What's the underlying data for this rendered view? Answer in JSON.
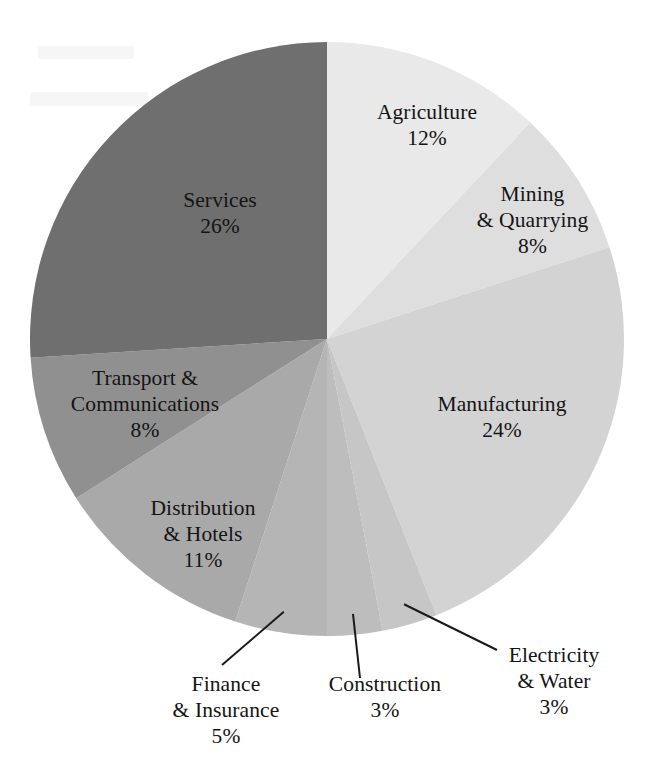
{
  "chart_data": {
    "type": "pie",
    "title": "",
    "subtitle": "",
    "xlabel": "",
    "ylabel": "",
    "units": "percent",
    "total": 100,
    "legend_position": "none",
    "grid": false,
    "start_angle_deg": 0,
    "direction": "clockwise",
    "categories": [
      "Agriculture",
      "Mining & Quarrying",
      "Manufacturing",
      "Electricity & Water",
      "Construction",
      "Finance & Insurance",
      "Distribution & Hotels",
      "Transport & Communications",
      "Services"
    ],
    "values": [
      12,
      8,
      24,
      3,
      3,
      5,
      11,
      8,
      26
    ],
    "slices": [
      {
        "name": "Agriculture",
        "line1": "Agriculture",
        "line2": "",
        "value": 12,
        "pct_label": "12%",
        "color": "#e9e9e9",
        "label_placement": "inside",
        "leader_line": false
      },
      {
        "name": "Mining & Quarrying",
        "line1": "Mining",
        "line2": "& Quarrying",
        "value": 8,
        "pct_label": "8%",
        "color": "#dedede",
        "label_placement": "inside",
        "leader_line": false
      },
      {
        "name": "Manufacturing",
        "line1": "Manufacturing",
        "line2": "",
        "value": 24,
        "pct_label": "24%",
        "color": "#d3d3d3",
        "label_placement": "inside",
        "leader_line": false
      },
      {
        "name": "Electricity & Water",
        "line1": "Electricity",
        "line2": "& Water",
        "value": 3,
        "pct_label": "3%",
        "color": "#c6c6c6",
        "label_placement": "outside",
        "leader_line": true
      },
      {
        "name": "Construction",
        "line1": "Construction",
        "line2": "",
        "value": 3,
        "pct_label": "3%",
        "color": "#bdbdbd",
        "label_placement": "outside",
        "leader_line": true
      },
      {
        "name": "Finance & Insurance",
        "line1": "Finance",
        "line2": "& Insurance",
        "value": 5,
        "pct_label": "5%",
        "color": "#b5b5b5",
        "label_placement": "outside",
        "leader_line": true
      },
      {
        "name": "Distribution & Hotels",
        "line1": "Distribution",
        "line2": "& Hotels",
        "value": 11,
        "pct_label": "11%",
        "color": "#a9a9a9",
        "label_placement": "inside",
        "leader_line": false
      },
      {
        "name": "Transport & Communications",
        "line1": "Transport &",
        "line2": "Communications",
        "value": 8,
        "pct_label": "8%",
        "color": "#909090",
        "label_placement": "inside",
        "leader_line": false
      },
      {
        "name": "Services",
        "line1": "Services",
        "line2": "",
        "value": 26,
        "pct_label": "26%",
        "color": "#6f6f6f",
        "label_placement": "inside",
        "leader_line": false
      }
    ]
  },
  "geometry": {
    "center_x": 327,
    "center_y": 339,
    "radius": 297
  },
  "labels": {
    "agriculture": {
      "l1": "Agriculture",
      "l2": "",
      "pct": "12%"
    },
    "mining": {
      "l1": "Mining",
      "l2": "& Quarrying",
      "pct": "8%"
    },
    "manufacturing": {
      "l1": "Manufacturing",
      "l2": "",
      "pct": "24%"
    },
    "electricity": {
      "l1": "Electricity",
      "l2": "& Water",
      "pct": "3%"
    },
    "construction": {
      "l1": "Construction",
      "l2": "",
      "pct": "3%"
    },
    "finance": {
      "l1": "Finance",
      "l2": "& Insurance",
      "pct": "5%"
    },
    "distribution": {
      "l1": "Distribution",
      "l2": "& Hotels",
      "pct": "11%"
    },
    "transport": {
      "l1": "Transport &",
      "l2": "Communications",
      "pct": "8%"
    },
    "services": {
      "l1": "Services",
      "l2": "",
      "pct": "26%"
    }
  }
}
